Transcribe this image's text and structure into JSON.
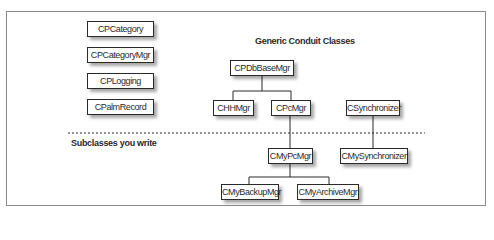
{
  "diagram": {
    "generic_title": "Generic Conduit Classes",
    "subclass_title": "Subclasses you write",
    "utility_classes": [
      {
        "label": "CPCategory"
      },
      {
        "label": "CPCategoryMgr"
      },
      {
        "label": "CPLogging"
      },
      {
        "label": "CPalmRecord"
      }
    ],
    "generic_classes": {
      "base": "CPDbBaseMgr",
      "hh_mgr": "CHHMgr",
      "pc_mgr": "CPcMgr",
      "synchronizer": "CSynchronizer"
    },
    "subclasses": {
      "my_pc_mgr": "CMyPcMgr",
      "my_synchronizer": "CMySynchronizer",
      "my_backup_mgr": "CMyBackupMgr",
      "my_archive_mgr": "CMyArchiveMgr"
    },
    "colors": {
      "line": "#2a2a2a",
      "frame": "#8a8a8a",
      "background": "#ffffff"
    }
  }
}
